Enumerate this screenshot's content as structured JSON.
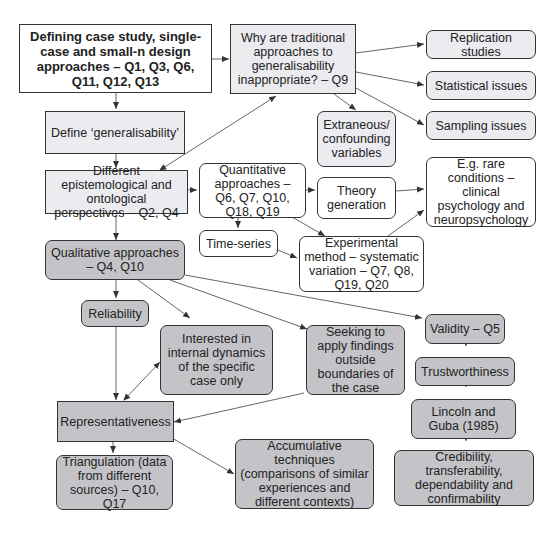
{
  "diagram": {
    "nodes": {
      "defining": "Defining case study, single-case and small-n design approaches – Q1, Q3, Q6, Q11, Q12, Q13",
      "why": "Why are traditional approaches to generalisability inappropriate? – Q9",
      "replication": "Replication studies",
      "statistical": "Statistical issues",
      "sampling": "Sampling issues",
      "define_gen": "Define ‘generalisability’",
      "extraneous": "Extraneous/ confounding variables",
      "epistemological": "Different epistemological and ontological perspectives – Q2, Q4",
      "quantitative": "Quantitative approaches – Q6, Q7, Q10, Q18, Q19",
      "theory": "Theory generation",
      "rare": "E.g. rare conditions – clinical psychology and neuropsychology",
      "timeseries": "Time-series",
      "experimental": "Experimental method – systematic variation – Q7, Q8, Q19, Q20",
      "qualitative": "Qualitative approaches – Q4, Q10",
      "reliability": "Reliability",
      "interested": "Interested in internal dynamics of the specific case only",
      "seeking": "Seeking to apply findings outside boundaries of the case",
      "validity": "Validity – Q5",
      "trustworthiness": "Trustworthiness",
      "lincoln": "Lincoln and Guba (1985)",
      "representativeness": "Representativeness",
      "triangulation": "Triangulation (data from different sources) – Q10, Q17",
      "accumulative": "Accumulative techniques (comparisons of similar experiences and different contexts)",
      "credibility": "Credibility, transferability, dependability and confirmability"
    },
    "colors": {
      "light_fill": "#ebebf0",
      "dark_fill": "#c4c4c8",
      "white_fill": "#ffffff",
      "border": "#333333",
      "arrow": "#444444"
    }
  }
}
